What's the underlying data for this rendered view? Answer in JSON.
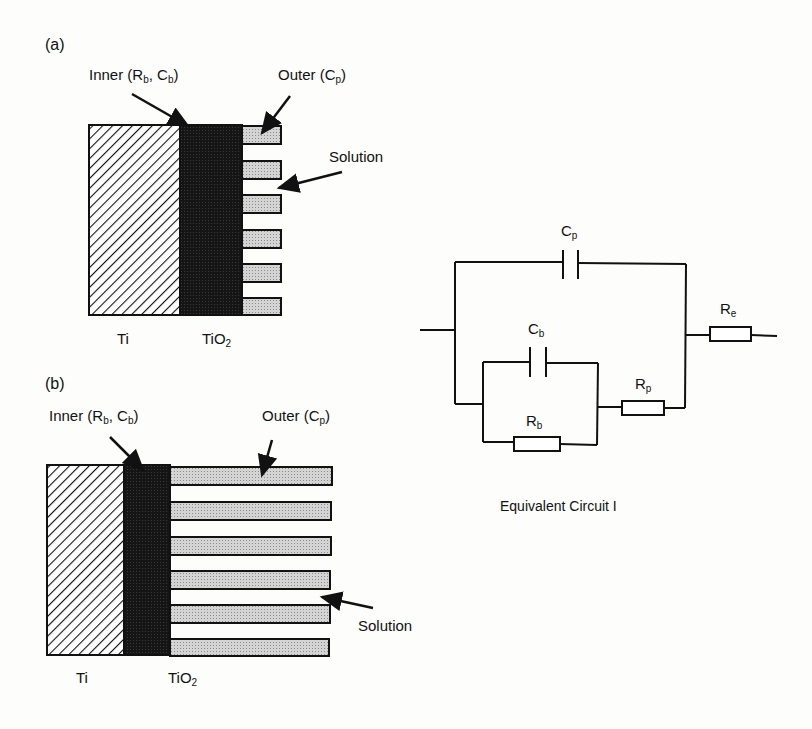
{
  "panel_a": {
    "tag": "(a)",
    "inner_label": "Inner (R",
    "inner_sub1": "b",
    "inner_mid": ", C",
    "inner_sub2": "b",
    "inner_end": ")",
    "outer_label": "Outer (C",
    "outer_sub": "p",
    "outer_end": ")",
    "solution": "Solution",
    "ti": "Ti",
    "tio2": "TiO",
    "tio2_sub": "2"
  },
  "panel_b": {
    "tag": "(b)",
    "inner_label": "Inner (R",
    "inner_sub1": "b",
    "inner_mid": ", C",
    "inner_sub2": "b",
    "inner_end": ")",
    "outer_label": "Outer (C",
    "outer_sub": "p",
    "outer_end": ")",
    "solution": "Solution",
    "ti": "Ti",
    "tio2": "TiO",
    "tio2_sub": "2"
  },
  "circuit": {
    "cp": "C",
    "cp_sub": "p",
    "cb": "C",
    "cb_sub": "b",
    "rb": "R",
    "rb_sub": "b",
    "rp": "R",
    "rp_sub": "p",
    "re": "R",
    "re_sub": "e",
    "caption": "Equivalent Circuit I"
  }
}
